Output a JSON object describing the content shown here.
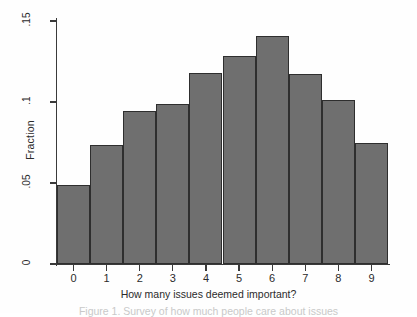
{
  "figure": {
    "background_color": "#fefefe",
    "bar_fill_color": "#6f6f6f",
    "bar_edge_color": "#2e2e2e",
    "axis_color": "#3a3a3a"
  },
  "caption": {
    "text": "Figure 1. Survey of how much people care about issues"
  },
  "chart_data": {
    "type": "bar",
    "title": "",
    "xlabel": "How many issues deemed important?",
    "ylabel": "Fraction",
    "categories": [
      "0",
      "1",
      "2",
      "3",
      "4",
      "5",
      "6",
      "7",
      "8",
      "9"
    ],
    "values": [
      0.049,
      0.0735,
      0.0945,
      0.0985,
      0.118,
      0.1285,
      0.141,
      0.117,
      0.1015,
      0.0745
    ],
    "xlim": [
      -0.5,
      9.5
    ],
    "ylim": [
      0,
      0.15
    ],
    "ytick_values": [
      0,
      0.05,
      0.1,
      0.15
    ],
    "ytick_labels": [
      "0",
      ".05",
      ".1",
      ".15"
    ],
    "xtick_labels": [
      "0",
      "1",
      "2",
      "3",
      "4",
      "5",
      "6",
      "7",
      "8",
      "9"
    ],
    "grid": false,
    "legend": null
  }
}
